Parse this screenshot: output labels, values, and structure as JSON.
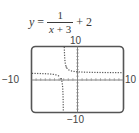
{
  "equation": {
    "lhs": "y",
    "equals": "=",
    "numerator": "1",
    "denominator_var": "x",
    "denominator_rest": " + 3",
    "tail": "+ 2"
  },
  "axis_labels": {
    "ymax": "10",
    "ymin": "−10",
    "xmin": "−10",
    "xmax": "10"
  },
  "chart_data": {
    "type": "line",
    "function": "1/(x+3)+2",
    "xlabel": "",
    "ylabel": "",
    "xlim": [
      -10,
      10
    ],
    "ylim": [
      -10,
      10
    ],
    "xscale_ticks": 1,
    "yscale_ticks": 1,
    "grid": false,
    "line_style": "dotted",
    "vertical_asymptote": -3,
    "horizontal_asymptote": 2,
    "series": [
      {
        "name": "y = 1/(x+3) + 2 (left branch)",
        "x": [
          -10,
          -8,
          -6,
          -5,
          -4,
          -3.5,
          -3.2,
          -3.1
        ],
        "y": [
          1.857,
          1.8,
          1.667,
          1.5,
          1.0,
          0.0,
          -3.0,
          -8.0
        ]
      },
      {
        "name": "y = 1/(x+3) + 2 (right branch)",
        "x": [
          -2.875,
          -2.8,
          -2.5,
          -2,
          -1,
          0,
          2,
          5,
          10
        ],
        "y": [
          10.0,
          7.0,
          4.0,
          3.0,
          2.5,
          2.333,
          2.2,
          2.125,
          2.077
        ]
      }
    ]
  }
}
